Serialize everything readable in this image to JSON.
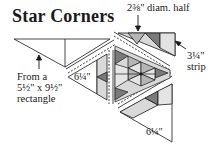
{
  "title": "Star Corners",
  "labels": {
    "half_diam": "2⅜\" diam. half",
    "strip_line1": "3¼\"",
    "strip_line2": "strip",
    "rect_line1": "From a",
    "rect_line2": "5½\" x 9½\"",
    "rect_line3": "rectangle",
    "left_triangle": "6¼\"",
    "bottom_triangle": "6¼\""
  },
  "icons": {
    "arrow_down": "arrow-down-icon",
    "arrow_up": "arrow-up-icon",
    "arrow_diag": "arrow-diagonal-icon"
  },
  "colors": {
    "light_gray": "#d9d9d9",
    "mid_gray": "#b5b5b5",
    "dark_gray": "#7a7a7a",
    "line": "#1a1a1a"
  }
}
